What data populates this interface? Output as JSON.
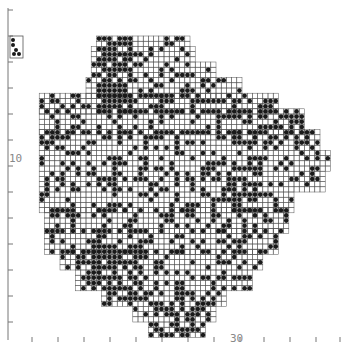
{
  "map": {
    "type": "grid-distribution-map",
    "cell_px": 5.2,
    "origin_px": [
      8,
      10
    ],
    "colors": {
      "grid": "#555555",
      "dot": "#1a1a1a",
      "axis": "#777777",
      "label": "#888888"
    },
    "axis": {
      "left_label": "10",
      "bottom_label": "30",
      "left_ticks_y": [
        10,
        36,
        62,
        88,
        114,
        140,
        166,
        192,
        218,
        244,
        270,
        296,
        322
      ],
      "bottom_ticks_x": [
        32,
        58,
        84,
        110,
        136,
        162,
        188,
        214,
        240,
        264,
        290,
        316,
        340
      ]
    },
    "inset": {
      "x": 10,
      "y": 36,
      "w": 13,
      "h": 22
    },
    "rows": [
      {
        "y": [
          35,
          45
        ],
        "x": [
          95,
          185
        ]
      },
      {
        "y": [
          45,
          60
        ],
        "x": [
          92,
          190
        ]
      },
      {
        "y": [
          60,
          75
        ],
        "x": [
          90,
          215
        ]
      },
      {
        "y": [
          75,
          95
        ],
        "x": [
          85,
          240
        ]
      },
      {
        "y": [
          95,
          110
        ],
        "x": [
          38,
          275
        ]
      },
      {
        "y": [
          110,
          130
        ],
        "x": [
          38,
          300
        ]
      },
      {
        "y": [
          130,
          150
        ],
        "x": [
          40,
          315
        ]
      },
      {
        "y": [
          150,
          170
        ],
        "x": [
          40,
          330
        ]
      },
      {
        "y": [
          170,
          190
        ],
        "x": [
          38,
          320
        ]
      },
      {
        "y": [
          190,
          210
        ],
        "x": [
          38,
          290
        ]
      },
      {
        "y": [
          210,
          230
        ],
        "x": [
          42,
          285
        ]
      },
      {
        "y": [
          230,
          250
        ],
        "x": [
          45,
          275
        ]
      },
      {
        "y": [
          250,
          270
        ],
        "x": [
          60,
          260
        ]
      },
      {
        "y": [
          270,
          290
        ],
        "x": [
          75,
          250
        ]
      },
      {
        "y": [
          290,
          305
        ],
        "x": [
          100,
          225
        ]
      },
      {
        "y": [
          305,
          320
        ],
        "x": [
          135,
          215
        ]
      },
      {
        "y": [
          320,
          335
        ],
        "x": [
          150,
          205
        ]
      }
    ],
    "dense_zones": [
      {
        "x": [
          92,
          130
        ],
        "y": [
          35,
          110
        ],
        "p": 0.8
      },
      {
        "x": [
          80,
          140
        ],
        "y": [
          240,
          300
        ],
        "p": 0.75
      },
      {
        "x": [
          140,
          210
        ],
        "y": [
          290,
          335
        ],
        "p": 0.65
      },
      {
        "x": [
          230,
          300
        ],
        "y": [
          95,
          140
        ],
        "p": 0.5
      },
      {
        "x": [
          200,
          260
        ],
        "y": [
          160,
          200
        ],
        "p": 0.55
      }
    ],
    "base_density": 0.3
  }
}
